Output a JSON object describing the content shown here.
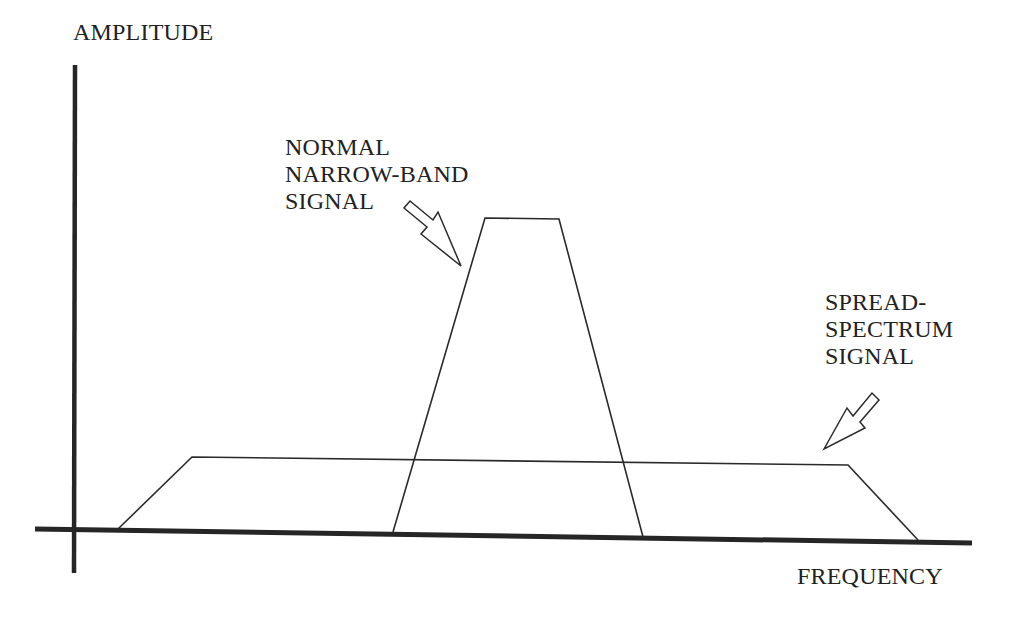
{
  "diagram": {
    "axes": {
      "y_label": "AMPLITUDE",
      "x_label": "FREQUENCY"
    },
    "annotations": {
      "narrow_band": {
        "lines": [
          "NORMAL",
          "NARROW-BAND",
          "SIGNAL"
        ]
      },
      "spread_spectrum": {
        "lines": [
          "SPREAD-",
          "SPECTRUM",
          "SIGNAL"
        ]
      }
    },
    "shapes": {
      "narrow_band_signal": {
        "description": "Tall narrow trapezoid (high amplitude, narrow bandwidth)",
        "points": [
          [
            393,
            532
          ],
          [
            485,
            218
          ],
          [
            559,
            219
          ],
          [
            643,
            537
          ]
        ]
      },
      "spread_spectrum_signal": {
        "description": "Low wide trapezoid (low amplitude, wide bandwidth)",
        "points": [
          [
            118,
            529
          ],
          [
            192,
            457
          ],
          [
            848,
            465
          ],
          [
            918,
            540
          ]
        ]
      }
    },
    "colors": {
      "stroke": "#2a2a2a",
      "axis": "#262626",
      "background": "#ffffff"
    }
  }
}
